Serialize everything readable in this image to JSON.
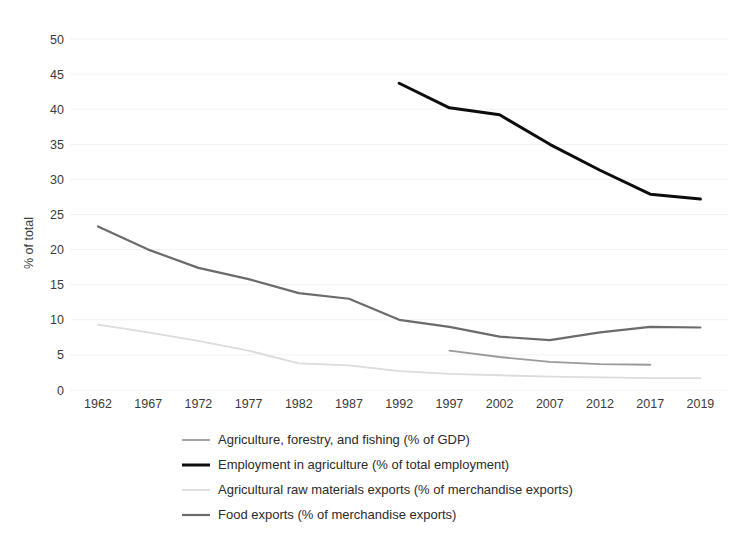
{
  "chart_data": {
    "type": "line",
    "title": "",
    "xlabel": "",
    "ylabel": "% of total",
    "ylim": [
      0,
      50
    ],
    "ytick_step": 5,
    "grid": true,
    "legend_position": "bottom",
    "x": [
      1962,
      1967,
      1972,
      1977,
      1982,
      1987,
      1992,
      1997,
      2002,
      2007,
      2012,
      2017,
      2019
    ],
    "categories": [
      "1962",
      "1967",
      "1972",
      "1977",
      "1982",
      "1987",
      "1992",
      "1997",
      "2002",
      "2007",
      "2012",
      "2017",
      "2019"
    ],
    "yticks": [
      "0",
      "5",
      "10",
      "15",
      "20",
      "25",
      "30",
      "35",
      "40",
      "45",
      "50"
    ],
    "series": [
      {
        "name": "Agriculture, forestry, and fishing (% of GDP)",
        "color": "#9a9a9a",
        "width": 1.8,
        "x": [
          1997,
          2002,
          2007,
          2012,
          2017
        ],
        "values": [
          5.6,
          4.7,
          4.0,
          3.7,
          3.6
        ]
      },
      {
        "name": "Employment in agriculture (% of total employment)",
        "color": "#0d0d0d",
        "width": 3.0,
        "x": [
          1992,
          1997,
          2002,
          2007,
          2012,
          2017,
          2019
        ],
        "values": [
          43.7,
          40.2,
          39.2,
          35.0,
          31.3,
          27.9,
          27.2
        ]
      },
      {
        "name": "Agricultural raw materials exports (% of merchandise exports)",
        "color": "#dcdcdc",
        "width": 1.8,
        "x": [
          1962,
          1967,
          1972,
          1977,
          1982,
          1987,
          1992,
          1997,
          2002,
          2007,
          2012,
          2017,
          2019
        ],
        "values": [
          9.3,
          8.2,
          7.0,
          5.6,
          3.8,
          3.5,
          2.7,
          2.3,
          2.1,
          1.9,
          1.8,
          1.7,
          1.7
        ]
      },
      {
        "name": "Food exports (% of merchandise exports)",
        "color": "#6b6b6b",
        "width": 2.2,
        "x": [
          1962,
          1967,
          1972,
          1977,
          1982,
          1987,
          1992,
          1997,
          2002,
          2007,
          2012,
          2017,
          2019
        ],
        "values": [
          23.3,
          20.0,
          17.4,
          15.8,
          13.8,
          13.0,
          10.0,
          9.0,
          7.6,
          7.1,
          8.2,
          9.0,
          8.9
        ]
      }
    ]
  }
}
